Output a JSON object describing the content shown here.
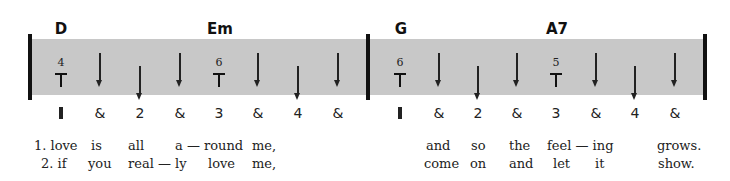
{
  "measures": [
    {
      "chords": [
        {
          "label": "D",
          "x": 61
        },
        {
          "label": "Em",
          "x": 220
        }
      ],
      "thumb_markers": [
        {
          "string": "4",
          "x": 61
        },
        {
          "string": "6",
          "x": 219
        }
      ],
      "strums": [
        {
          "beat": "&",
          "x": 100,
          "type": "up-beat"
        },
        {
          "beat": "2",
          "x": 140,
          "type": "down-beat"
        },
        {
          "beat": "&",
          "x": 180,
          "type": "up-beat"
        },
        {
          "beat": "&",
          "x": 258,
          "type": "up-beat"
        },
        {
          "beat": "4",
          "x": 298,
          "type": "down-beat"
        },
        {
          "beat": "&",
          "x": 338,
          "type": "up-beat"
        }
      ],
      "beats": [
        {
          "label": "1",
          "x": 61
        },
        {
          "label": "&",
          "x": 100
        },
        {
          "label": "2",
          "x": 140
        },
        {
          "label": "&",
          "x": 180
        },
        {
          "label": "3",
          "x": 219
        },
        {
          "label": "&",
          "x": 258
        },
        {
          "label": "4",
          "x": 298
        },
        {
          "label": "&",
          "x": 338
        }
      ],
      "lyrics_line1": [
        {
          "text": "1. love",
          "x": 34
        },
        {
          "text": "is",
          "x": 91
        },
        {
          "text": "all",
          "x": 128
        },
        {
          "text": "a — round",
          "x": 175
        },
        {
          "text": "me,",
          "x": 252
        }
      ],
      "lyrics_line2": [
        {
          "text": "2. if",
          "x": 41
        },
        {
          "text": "you",
          "x": 88
        },
        {
          "text": "real — ly",
          "x": 128
        },
        {
          "text": "love",
          "x": 208
        },
        {
          "text": "me,",
          "x": 252
        }
      ]
    },
    {
      "chords": [
        {
          "label": "G",
          "x": 401
        },
        {
          "label": "A7",
          "x": 557
        }
      ],
      "thumb_markers": [
        {
          "string": "6",
          "x": 400
        },
        {
          "string": "5",
          "x": 556
        }
      ],
      "strums": [
        {
          "beat": "&",
          "x": 439,
          "type": "up-beat"
        },
        {
          "beat": "2",
          "x": 478,
          "type": "down-beat"
        },
        {
          "beat": "&",
          "x": 517,
          "type": "up-beat"
        },
        {
          "beat": "&",
          "x": 596,
          "type": "up-beat"
        },
        {
          "beat": "4",
          "x": 635,
          "type": "down-beat"
        },
        {
          "beat": "&",
          "x": 675,
          "type": "up-beat"
        }
      ],
      "beats": [
        {
          "label": "1",
          "x": 400
        },
        {
          "label": "&",
          "x": 439
        },
        {
          "label": "2",
          "x": 478
        },
        {
          "label": "&",
          "x": 517
        },
        {
          "label": "3",
          "x": 556
        },
        {
          "label": "&",
          "x": 596
        },
        {
          "label": "4",
          "x": 635
        },
        {
          "label": "&",
          "x": 675
        }
      ],
      "lyrics_line1": [
        {
          "text": "and",
          "x": 426
        },
        {
          "text": "so",
          "x": 471
        },
        {
          "text": "the",
          "x": 509
        },
        {
          "text": "feel — ing",
          "x": 547
        },
        {
          "text": "grows.",
          "x": 657
        }
      ],
      "lyrics_line2": [
        {
          "text": "come",
          "x": 424
        },
        {
          "text": "on",
          "x": 470
        },
        {
          "text": "and",
          "x": 509
        },
        {
          "text": "let",
          "x": 553
        },
        {
          "text": "it",
          "x": 595
        },
        {
          "text": "show.",
          "x": 658
        }
      ]
    }
  ],
  "colors": {
    "band": "#c8c8c8",
    "ink": "#111111"
  }
}
